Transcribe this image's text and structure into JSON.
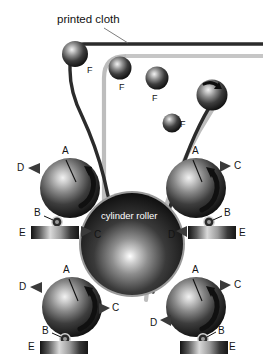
{
  "figure": {
    "title": "printed cloth",
    "center_part_label": "cylinder roller",
    "background_color": "#ffffff",
    "ink_color": "#1a1a1a",
    "cloth_dark_color": "#262626",
    "cloth_gray_color": "#b5b5b5"
  },
  "labels": {
    "A": "A",
    "B": "B",
    "C": "C",
    "D": "D",
    "E": "E",
    "F": "F"
  },
  "guide_rollers": [
    {
      "id": "f-top-left",
      "label": "F",
      "cx": 75,
      "cy": 54,
      "r": 13
    },
    {
      "id": "f-top-mid",
      "label": "F",
      "cx": 120,
      "cy": 68,
      "r": 11
    },
    {
      "id": "f-top-right",
      "label": "F",
      "cx": 157,
      "cy": 78,
      "r": 11
    },
    {
      "id": "f-upper-right",
      "label": "F",
      "cx": 212,
      "cy": 95,
      "r": 15
    },
    {
      "id": "f-mid-right",
      "label": "F",
      "cx": 172,
      "cy": 123,
      "r": 9
    }
  ],
  "roller_units": [
    {
      "id": "unit-left-upper",
      "cx": 70,
      "cy": 188,
      "r": 30,
      "labels": [
        "A",
        "B",
        "C",
        "D",
        "E"
      ],
      "pad": {
        "x": 31,
        "y": 224,
        "w": 48,
        "h": 14
      }
    },
    {
      "id": "unit-right-upper",
      "cx": 196,
      "cy": 188,
      "r": 30,
      "labels": [
        "A",
        "B",
        "C",
        "D",
        "E"
      ],
      "pad": {
        "x": 188,
        "y": 224,
        "w": 48,
        "h": 14
      }
    },
    {
      "id": "unit-left-lower",
      "cx": 72,
      "cy": 307,
      "r": 30,
      "labels": [
        "A",
        "B",
        "C",
        "D",
        "E"
      ],
      "pad": {
        "x": 40,
        "y": 337,
        "w": 48,
        "h": 14
      }
    },
    {
      "id": "unit-right-lower",
      "cx": 196,
      "cy": 307,
      "r": 30,
      "labels": [
        "A",
        "B",
        "C",
        "D",
        "E"
      ],
      "pad": {
        "x": 180,
        "y": 337,
        "w": 48,
        "h": 14
      }
    }
  ],
  "center_roller": {
    "cx": 132,
    "cy": 244,
    "r": 52
  }
}
